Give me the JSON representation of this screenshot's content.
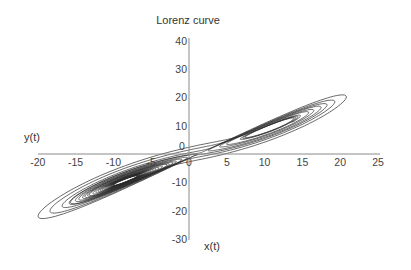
{
  "chart_data": {
    "type": "line",
    "title": "Lorenz curve",
    "xlabel": "x(t)",
    "ylabel": "y(t)",
    "xlim": [
      -20,
      25
    ],
    "ylim": [
      -30,
      40
    ],
    "x_ticks": [
      -20,
      -15,
      -10,
      -5,
      0,
      5,
      10,
      15,
      20,
      25
    ],
    "y_ticks": [
      40,
      30,
      20,
      10,
      0,
      -10,
      -20,
      -30
    ],
    "x_tick_labels": [
      "-20",
      "-15",
      "-10",
      "-5",
      "0",
      "5",
      "10",
      "15",
      "20",
      "25"
    ],
    "y_tick_labels": [
      "40",
      "30",
      "20",
      "10",
      "0",
      "-10",
      "-20",
      "-30"
    ],
    "origin_label": "0",
    "grid": false,
    "legend": null,
    "series": [
      {
        "name": "Lorenz attractor trajectory (x(t), y(t))",
        "description": "Two-lobed butterfly attractor; right lobe spirals around approx (8, 8), left lobe around approx (-8, -8)",
        "lorenz_params": {
          "sigma": 10,
          "rho": 28,
          "beta": 2.6667,
          "dt": 0.005,
          "steps": 5200,
          "start": [
            1,
            1,
            1
          ]
        },
        "line_color": "#2a2a2a"
      }
    ],
    "approx_extent": {
      "x_min": -18,
      "x_max": 20,
      "y_min": -22,
      "y_max": 30
    }
  },
  "layout": {
    "axis_color": "#8a8a8a"
  }
}
